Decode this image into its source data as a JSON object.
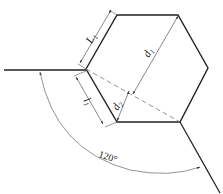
{
  "diagram": {
    "type": "hexagon-dimension-drawing",
    "colors": {
      "outline": "#222222",
      "dimension": "#555555",
      "dashed": "#777777"
    },
    "labels": {
      "L1": "L",
      "L1_sub": "1",
      "l1": "l",
      "l1_sub": "1",
      "d1": "d",
      "d1_sub": "1",
      "d2": "d",
      "d2_sub": "2",
      "angle": "120°"
    }
  }
}
